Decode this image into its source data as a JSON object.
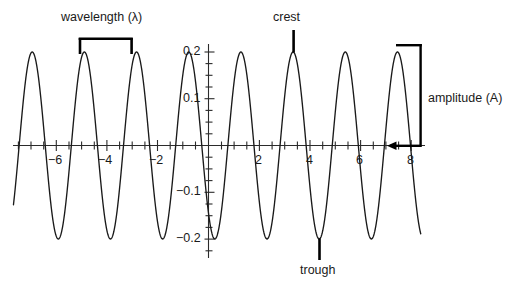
{
  "figure": {
    "kind": "wave-diagram",
    "background_color": "#ffffff",
    "curve_color": "#1a1a1a",
    "axis_color": "#2b2b2b",
    "annotation_color": "#000000"
  },
  "annotations": {
    "wavelength": {
      "label": "wavelength (λ)",
      "symbol": "λ",
      "from_x": -4.9,
      "to_x": -2.85
    },
    "crest": {
      "label": "crest",
      "at_x": 3.36,
      "at_y": 0.2
    },
    "trough": {
      "label": "trough",
      "at_x": 4.4,
      "at_y": -0.2
    },
    "amplitude": {
      "label": "amplitude (A)",
      "symbol": "A",
      "from_y": 0,
      "to_y": 0.2,
      "at_x": 8.2
    }
  },
  "axes": {
    "x_label": "",
    "y_label": "",
    "x_tick_labels": [
      "−6",
      "−4",
      "−2",
      "2",
      "4",
      "6",
      "8"
    ],
    "x_tick_values": [
      -6,
      -4,
      -2,
      2,
      4,
      6,
      8
    ],
    "y_tick_labels": [
      "0.2",
      "0.1",
      "−0.1",
      "−0.2"
    ],
    "y_tick_values": [
      0.2,
      0.1,
      -0.1,
      -0.2
    ],
    "x_minor_step": 0.5,
    "y_minor_step": 0.025
  },
  "chart_data": {
    "type": "line",
    "title": "",
    "subtitle": "",
    "xlabel": "",
    "ylabel": "",
    "xlim": [
      -7.7,
      8.4
    ],
    "ylim": [
      -0.24,
      0.24
    ],
    "grid": false,
    "legend": null,
    "series": [
      {
        "name": "wave",
        "form": "sinusoid",
        "amplitude": 0.2,
        "wavelength": 2.06,
        "phase_crest_x": -4.9,
        "x_start": -7.7,
        "x_end": 8.38,
        "annotations": [
          "crest",
          "trough",
          "wavelength",
          "amplitude"
        ]
      }
    ],
    "categories": [],
    "values": []
  }
}
